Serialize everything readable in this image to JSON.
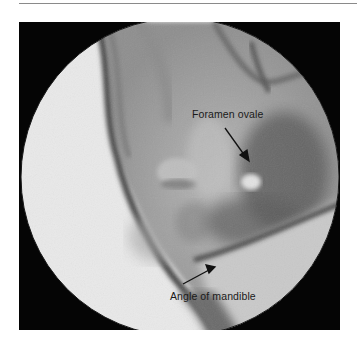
{
  "figure": {
    "type": "fluoroscopic radiograph (circular field)",
    "annotations": [
      {
        "label": "Foramen ovale",
        "arrow": "points down-right to bright oval opening"
      },
      {
        "label": "Angle of mandible",
        "arrow": "points up-right to mandibular angle"
      }
    ]
  },
  "colors": {
    "frame": "#050505",
    "background": "#ffffff",
    "rule": "#8a8a8a",
    "label_text": "#1a1a1a"
  }
}
